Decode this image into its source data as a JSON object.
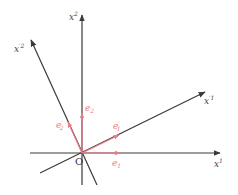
{
  "diagram": {
    "title": "",
    "colors": {
      "axis": "#3a3a3a",
      "vector": "#ef7a86",
      "background": "#ffffff"
    },
    "origin": {
      "label": "O"
    },
    "axes": [
      {
        "id": "x1",
        "label": "x",
        "sup": "1"
      },
      {
        "id": "x2",
        "label": "x",
        "sup": "2"
      },
      {
        "id": "xp1",
        "label": "x",
        "sup": "′1"
      },
      {
        "id": "xp2",
        "label": "x",
        "sup": "′2"
      }
    ],
    "vectors": [
      {
        "id": "e1",
        "label": "e",
        "sub": "1",
        "prime": ""
      },
      {
        "id": "e2",
        "label": "e",
        "sub": "2",
        "prime": ""
      },
      {
        "id": "ep1",
        "label": "e",
        "sub": "1",
        "prime": "′"
      },
      {
        "id": "ep2",
        "label": "e",
        "sub": "2",
        "prime": "′"
      }
    ]
  }
}
